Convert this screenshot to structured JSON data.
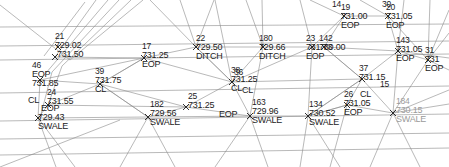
{
  "drawing": {
    "title": "Topographic Survey Point Map",
    "type": "cad-survey-tin",
    "width": 449,
    "height": 167,
    "background_color": "#ffffff",
    "line_color": "#808080",
    "text_color": "#1c1c1c",
    "faint_text_color": "#9a9a9a"
  },
  "points": [
    {
      "id": "p21",
      "num": "21",
      "elev": "729.02",
      "desc": "",
      "x": 55,
      "y": 36,
      "marker_x": 58,
      "marker_y": 47
    },
    {
      "id": "p16",
      "num": "",
      "elev": "731.50",
      "desc": "",
      "x": 57,
      "y": 52,
      "marker_x": 55,
      "marker_y": 57
    },
    {
      "id": "p46",
      "num": "46",
      "elev": "731.85",
      "desc": "EOP",
      "x": 36,
      "y": 62,
      "marker_x": 40,
      "marker_y": 80
    },
    {
      "id": "p39",
      "num": "39",
      "elev": "731.75",
      "desc": "CL",
      "x": 98,
      "y": 72,
      "marker_x": 100,
      "marker_y": 84
    },
    {
      "id": "p24",
      "num": "24",
      "elev": "731.55",
      "desc": "",
      "x": 45,
      "y": 92,
      "marker_x": 48,
      "marker_y": 105
    },
    {
      "id": "p72",
      "num": "",
      "elev": "729.43",
      "desc": "SWALE",
      "x": 36,
      "y": 112,
      "marker_x": 38,
      "marker_y": 118
    },
    {
      "id": "p17",
      "num": "17",
      "elev": "731.25",
      "desc": "EOP",
      "x": 140,
      "y": 44,
      "marker_x": 144,
      "marker_y": 58
    },
    {
      "id": "p22",
      "num": "22",
      "elev": "729.50",
      "desc": "DITCH",
      "x": 198,
      "y": 36,
      "marker_x": 196,
      "marker_y": 47
    },
    {
      "id": "p38",
      "num": "38",
      "elev": "731.25",
      "desc": "CL",
      "x": 232,
      "y": 68,
      "marker_x": 232,
      "marker_y": 82
    },
    {
      "id": "p180",
      "num": "180",
      "elev": "729.66",
      "desc": "DITCH",
      "x": 260,
      "y": 36,
      "marker_x": 263,
      "marker_y": 47
    },
    {
      "id": "p23",
      "num": "23",
      "elev": "731.73",
      "desc": "EOP",
      "x": 305,
      "y": 36,
      "marker_x": 312,
      "marker_y": 47
    },
    {
      "id": "p142",
      "num": "142",
      "elev": "730.00",
      "desc": "EOP",
      "x": 320,
      "y": 36,
      "marker_x": 324,
      "marker_y": 47
    },
    {
      "id": "p19",
      "num": "19",
      "elev": "731.00",
      "desc": "EOP",
      "x": 340,
      "y": 5,
      "marker_x": 344,
      "marker_y": 16
    },
    {
      "id": "p20",
      "num": "20",
      "elev": "731.05",
      "desc": "EOP",
      "x": 385,
      "y": 5,
      "marker_x": 388,
      "marker_y": 16
    },
    {
      "id": "p143",
      "num": "143",
      "elev": "731.05",
      "desc": "EOP",
      "x": 396,
      "y": 38,
      "marker_x": 398,
      "marker_y": 51
    },
    {
      "id": "p31",
      "num": "31",
      "elev": "731",
      "desc": "EOP",
      "x": 424,
      "y": 48,
      "marker_x": 428,
      "marker_y": 60
    },
    {
      "id": "p37",
      "num": "37",
      "elev": "731.15",
      "desc": "",
      "x": 360,
      "y": 66,
      "marker_x": 362,
      "marker_y": 79
    },
    {
      "id": "p26",
      "num": "26",
      "elev": "731.05",
      "desc": "EOP",
      "x": 344,
      "y": 92,
      "marker_x": 347,
      "marker_y": 105
    },
    {
      "id": "p26cl",
      "num": "",
      "elev": "",
      "desc": "CL",
      "x": 362,
      "y": 92,
      "marker_x": 0,
      "marker_y": 0
    },
    {
      "id": "p182",
      "num": "182",
      "elev": "729.56",
      "desc": "SWALE",
      "x": 152,
      "y": 102,
      "marker_x": 148,
      "marker_y": 117
    },
    {
      "id": "p25",
      "num": "25",
      "elev": "731.25",
      "desc": "EOP",
      "x": 189,
      "y": 94,
      "marker_x": 186,
      "marker_y": 107
    },
    {
      "id": "p163",
      "num": "163",
      "elev": "729.96",
      "desc": "SWALE",
      "x": 253,
      "y": 100,
      "marker_x": 250,
      "marker_y": 116
    },
    {
      "id": "p134",
      "num": "134",
      "elev": "730.52",
      "desc": "SWALE",
      "x": 310,
      "y": 102,
      "marker_x": 308,
      "marker_y": 116
    },
    {
      "id": "p184",
      "num": "184",
      "elev": "730.15",
      "desc": "SWALE",
      "x": 396,
      "y": 98,
      "marker_x": 393,
      "marker_y": 113
    },
    {
      "id": "p36",
      "num": "36",
      "elev": "",
      "desc": "",
      "x": 236,
      "y": 70,
      "marker_x": 0,
      "marker_y": 0
    },
    {
      "id": "p15",
      "num": "15",
      "elev": "",
      "desc": "",
      "x": 381,
      "y": 82,
      "marker_x": 0,
      "marker_y": 0
    },
    {
      "id": "p30",
      "num": "30",
      "elev": "",
      "desc": "",
      "x": 380,
      "y": 2,
      "marker_x": 0,
      "marker_y": 0
    },
    {
      "id": "p14",
      "num": "14",
      "elev": "",
      "desc": "",
      "x": 329,
      "y": 2,
      "marker_x": 0,
      "marker_y": 0
    }
  ],
  "labels": {
    "n21": "21",
    "e21": "729.02",
    "e16": "731.50",
    "n46": "46",
    "e46": "731.85",
    "d46": "EOP",
    "n39": "39",
    "e39": "731.75",
    "d39": "CL",
    "n24": "24",
    "e24": "731.55",
    "e72": "729.43",
    "d72": "SWALE",
    "n17": "17",
    "e17": "731.25",
    "d17": "EOP",
    "n22": "22",
    "e22": "729.50",
    "d22": "DITCH",
    "n38": "38",
    "e38": "731.25",
    "d38": "CL",
    "n180": "180",
    "e180": "729.66",
    "d180": "DITCH",
    "n23": "23",
    "e23": "731.73",
    "d23": "EOP",
    "n142": "142",
    "e142": "730.00",
    "n19": "19",
    "e19": "731.00",
    "d19": "EOP",
    "n20": "20",
    "e20": "731.05",
    "d20": "EOP",
    "n143": "143",
    "e143": "731.05",
    "d143": "EOP",
    "n31": "31",
    "e31": "731",
    "d31": "EOP",
    "n37": "37",
    "e37": "731.15",
    "n26": "26",
    "e26": "731.05",
    "d26": "EOP",
    "cl26": "CL",
    "n182": "182",
    "e182": "729.56",
    "d182": "SWALE",
    "n25": "25",
    "e25": "731.25",
    "d25": "EOP",
    "n163": "163",
    "e163": "729.96",
    "d163": "SWALE",
    "n134": "134",
    "e134": "730.52",
    "d134": "SWALE",
    "n184": "184",
    "e184": "730.15",
    "d184": "SWALE",
    "n36": "36",
    "n15": "15",
    "n30": "30",
    "n14": "14",
    "e14b": "731.00"
  }
}
